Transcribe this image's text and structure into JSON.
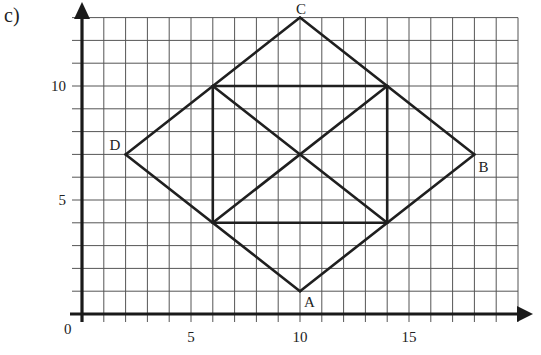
{
  "part_label": "c)",
  "grid": {
    "x_min": 0,
    "x_max": 20,
    "y_min": 0,
    "y_max": 13,
    "origin_px": [
      82,
      314
    ],
    "unit_px": [
      21.8,
      22.8
    ],
    "line_color": "#555555"
  },
  "axes": {
    "origin_label": "0",
    "x_ticks": [
      {
        "value": 5,
        "label": "5"
      },
      {
        "value": 10,
        "label": "10"
      },
      {
        "value": 15,
        "label": "15"
      }
    ],
    "y_ticks": [
      {
        "value": 5,
        "label": "5"
      },
      {
        "value": 10,
        "label": "10"
      }
    ],
    "color": "#1a1a1a"
  },
  "points": [
    {
      "name": "A",
      "x": 10,
      "y": 1,
      "label_dx": 4,
      "label_dy": 16
    },
    {
      "name": "B",
      "x": 18,
      "y": 7,
      "label_dx": 4,
      "label_dy": 18
    },
    {
      "name": "C",
      "x": 10,
      "y": 13,
      "label_dx": -4,
      "label_dy": -4
    },
    {
      "name": "D",
      "x": 2,
      "y": 7,
      "label_dx": -16,
      "label_dy": -4
    }
  ],
  "segments": [
    {
      "from": [
        10,
        1
      ],
      "to": [
        18,
        7
      ]
    },
    {
      "from": [
        18,
        7
      ],
      "to": [
        10,
        13
      ]
    },
    {
      "from": [
        10,
        13
      ],
      "to": [
        2,
        7
      ]
    },
    {
      "from": [
        2,
        7
      ],
      "to": [
        10,
        1
      ]
    },
    {
      "from": [
        6,
        4
      ],
      "to": [
        14,
        4
      ]
    },
    {
      "from": [
        14,
        4
      ],
      "to": [
        14,
        10
      ]
    },
    {
      "from": [
        14,
        10
      ],
      "to": [
        6,
        10
      ]
    },
    {
      "from": [
        6,
        10
      ],
      "to": [
        6,
        4
      ]
    },
    {
      "from": [
        6,
        10
      ],
      "to": [
        14,
        4
      ]
    },
    {
      "from": [
        6,
        4
      ],
      "to": [
        14,
        10
      ]
    }
  ],
  "shape_color": "#1f1f1f"
}
